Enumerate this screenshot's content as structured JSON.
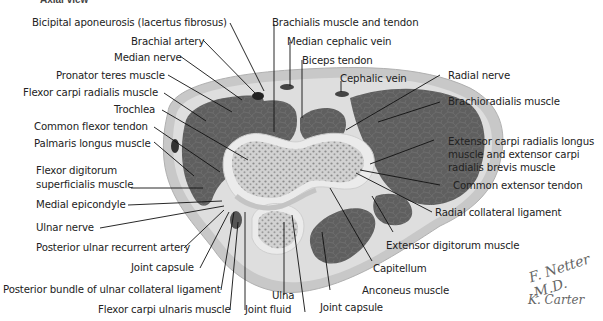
{
  "title": "Axial view",
  "labels": {
    "bicipital_aponeurosis": "Bicipital aponeurosis (lacertus fibrosus)",
    "brachial_artery": "Brachial artery",
    "median_nerve": "Median nerve",
    "pronator_teres": "Pronator teres muscle",
    "flexor_carpi_radialis": "Flexor carpi radialis muscle",
    "trochlea": "Trochlea",
    "common_flexor_tendon": "Common flexor tendon",
    "palmaris_longus": "Palmaris longus muscle",
    "fds_line1": "Flexor digitorum",
    "fds_line2": "superficialis muscle",
    "medial_epicondyle": "Medial epicondyle",
    "ulnar_nerve": "Ulnar nerve",
    "posterior_ulnar_recurrent_artery": "Posterior ulnar recurrent artery",
    "joint_capsule_left": "Joint capsule",
    "posterior_bundle_ucl": "Posterior bundle of ulnar collateral ligament",
    "flexor_carpi_ulnaris": "Flexor carpi ulnaris muscle",
    "joint_fluid": "Joint fluid",
    "ulna": "Ulna",
    "joint_capsule_bottom": "Joint capsule",
    "anconeus": "Anconeus muscle",
    "capitellum": "Capitellum",
    "extensor_digitorum": "Extensor digitorum muscle",
    "radial_collateral_ligament": "Radial collateral ligament",
    "common_extensor_tendon": "Common extensor tendon",
    "ecrl_line1": "Extensor carpi radialis longus",
    "ecrl_line2": "muscle and extensor carpi",
    "ecrl_line3": "radialis brevis muscle",
    "brachioradialis": "Brachioradialis muscle",
    "radial_nerve": "Radial nerve",
    "brachialis": "Brachialis muscle and tendon",
    "median_cephalic_vein": "Median cephalic vein",
    "biceps_tendon": "Biceps tendon",
    "cephalic_vein": "Cephalic vein"
  },
  "signature": {
    "line1": "F. Netter M.D.",
    "line2": "K. Carter"
  },
  "colors": {
    "skin": "#c9c9c9",
    "fat": "#dcdcdc",
    "muscle": "#5e5e5e",
    "bone_cortex": "#e8e8e8",
    "bone_marrow": "#b8b8b8",
    "leader": "#111111"
  }
}
